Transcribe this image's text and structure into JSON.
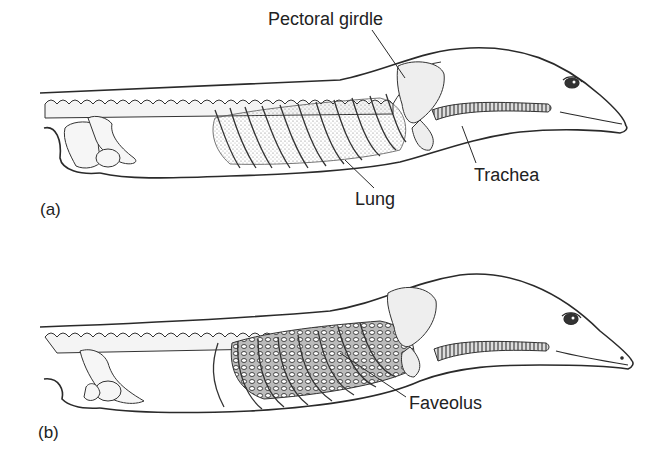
{
  "figure": {
    "panels": [
      {
        "id": "a",
        "letter": "(a)",
        "labels": {
          "pectoral_girdle": "Pectoral girdle",
          "trachea": "Trachea",
          "lung": "Lung"
        }
      },
      {
        "id": "b",
        "letter": "(b)",
        "labels": {
          "faveolus": "Faveolus"
        }
      }
    ],
    "colors": {
      "line": "#2a2a2a",
      "shade": "#9a9a9a",
      "background": "#ffffff"
    }
  }
}
